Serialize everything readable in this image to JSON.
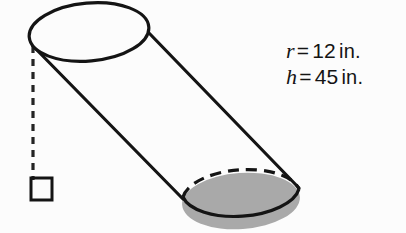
{
  "figure": {
    "background_color": "#fcfcfc",
    "stroke_color": "#141414",
    "fill_gray": "#a9a9a9",
    "labels": {
      "radius": {
        "variable": "r",
        "equals": "=",
        "value": "12",
        "unit": "in."
      },
      "height": {
        "variable": "h",
        "equals": "=",
        "value": "45",
        "unit": "in."
      }
    },
    "parts": {
      "top_face": "top-ellipse",
      "bottom_face": "bottom-ellipse-shaded",
      "left_side": "left-slant-line",
      "right_side": "right-slant-line",
      "height_line": "dashed-height-line",
      "right_angle_marker": "right-angle-square"
    }
  }
}
